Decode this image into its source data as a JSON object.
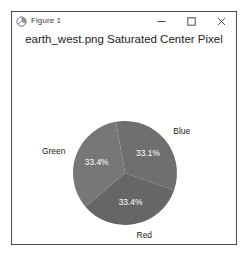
{
  "window": {
    "title": "Figure 1",
    "icon": "matplotlib-figure-icon",
    "controls": {
      "minimize_label": "—",
      "maximize_label": "□",
      "close_label": "✕"
    }
  },
  "chart_data": {
    "type": "pie",
    "title": "earth_west.png Saturated Center Pixel",
    "xlabel": "",
    "ylabel": "",
    "categories": [
      "Blue",
      "Red",
      "Green"
    ],
    "values": [
      33.1,
      33.4,
      33.4
    ],
    "labels": [
      "33.1%",
      "33.4%",
      "33.4%"
    ],
    "startangle_deg": 100,
    "direction": "clockwise",
    "legend": "none",
    "grid": false,
    "slice_colors": [
      "#6f6f6f",
      "#666666",
      "#777777"
    ],
    "label_text_color": "#ffffff",
    "category_text_color": "#1a1a1a"
  }
}
